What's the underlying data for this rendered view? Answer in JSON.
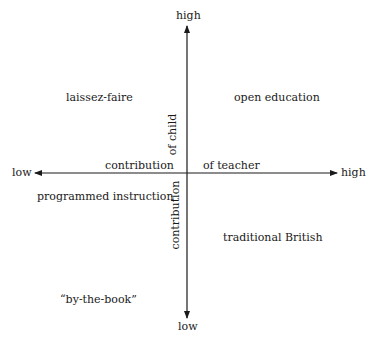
{
  "diagram": {
    "type": "quadrant",
    "x_axis": {
      "label_left": "contribution",
      "label_right": "of teacher",
      "low": "low",
      "high": "high"
    },
    "y_axis": {
      "label_upper": "of child",
      "label_lower": "contribution",
      "low": "low",
      "high": "high"
    },
    "quadrants": {
      "upper_left": "laissez-faire",
      "upper_right": "open education",
      "lower_left_upper": "programmed instruction",
      "lower_left_lower": "“by-the-book”",
      "lower_right": "traditional British"
    },
    "colors": {
      "line": "#1a1a1a",
      "background": "#ffffff"
    }
  }
}
